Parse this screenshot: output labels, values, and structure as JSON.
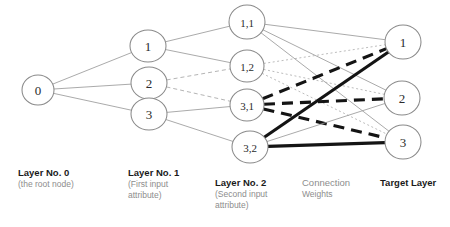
{
  "figure": {
    "background": "#ffffff"
  },
  "colors": {
    "node_stroke": "#8a8a8a",
    "node_fill": "#ffffff",
    "node_label": "#2b2b2b",
    "thin_edge": "#9b9b9b",
    "thick_edge": "#141414",
    "caption_title": "#1a1a1a",
    "caption_sub": "#8d8d8d"
  },
  "nodes": {
    "layer0": [
      {
        "id": "n0",
        "label": "0",
        "cx": 38,
        "cy": 90,
        "rx": 16,
        "ry": 15
      }
    ],
    "layer1": [
      {
        "id": "l1a",
        "label": "1",
        "cx": 148,
        "cy": 46,
        "rx": 18,
        "ry": 16
      },
      {
        "id": "l1b",
        "label": "2",
        "cx": 149,
        "cy": 83,
        "rx": 18,
        "ry": 16
      },
      {
        "id": "l1c",
        "label": "3",
        "cx": 149,
        "cy": 114,
        "rx": 18,
        "ry": 16
      }
    ],
    "layer2": [
      {
        "id": "l2a",
        "label": "1,1",
        "cx": 247,
        "cy": 22,
        "rx": 18,
        "ry": 17
      },
      {
        "id": "l2b",
        "label": "1,2",
        "cx": 247,
        "cy": 66,
        "rx": 17,
        "ry": 16
      },
      {
        "id": "l2c",
        "label": "3,1",
        "cx": 247,
        "cy": 105,
        "rx": 17,
        "ry": 16
      },
      {
        "id": "l2d",
        "label": "3,2",
        "cx": 250,
        "cy": 147,
        "rx": 18,
        "ry": 16
      }
    ],
    "target": [
      {
        "id": "t1",
        "label": "1",
        "cx": 403,
        "cy": 42,
        "rx": 18,
        "ry": 17
      },
      {
        "id": "t2",
        "label": "2",
        "cx": 402,
        "cy": 98,
        "rx": 18,
        "ry": 17
      },
      {
        "id": "t3",
        "label": "3",
        "cx": 403,
        "cy": 142,
        "rx": 18,
        "ry": 17
      }
    ]
  },
  "edges": [
    {
      "from": "n0",
      "to": "l1a",
      "style": "thin-solid"
    },
    {
      "from": "n0",
      "to": "l1b",
      "style": "thin-solid"
    },
    {
      "from": "n0",
      "to": "l1c",
      "style": "thin-solid"
    },
    {
      "from": "l1a",
      "to": "l2a",
      "style": "thin-solid"
    },
    {
      "from": "l1a",
      "to": "l2b",
      "style": "thin-solid"
    },
    {
      "from": "l1b",
      "to": "l2b",
      "style": "thin-dashed"
    },
    {
      "from": "l1b",
      "to": "l2c",
      "style": "thin-dashed"
    },
    {
      "from": "l1c",
      "to": "l2c",
      "style": "thin-solid"
    },
    {
      "from": "l1c",
      "to": "l2d",
      "style": "thin-solid"
    },
    {
      "from": "l2a",
      "to": "t1",
      "style": "thin-solid"
    },
    {
      "from": "l2a",
      "to": "t2",
      "style": "thin-solid"
    },
    {
      "from": "l2a",
      "to": "t3",
      "style": "thin-solid"
    },
    {
      "from": "l2b",
      "to": "t1",
      "style": "thin-dotted"
    },
    {
      "from": "l2b",
      "to": "t2",
      "style": "thin-dotted"
    },
    {
      "from": "l2b",
      "to": "t3",
      "style": "thin-dotted"
    },
    {
      "from": "l2c",
      "to": "t1",
      "style": "thick-dashed"
    },
    {
      "from": "l2c",
      "to": "t2",
      "style": "thick-dashed"
    },
    {
      "from": "l2c",
      "to": "t3",
      "style": "thick-dashed"
    },
    {
      "from": "l2d",
      "to": "t1",
      "style": "thick-solid"
    },
    {
      "from": "l2d",
      "to": "t2",
      "style": "thin-solid"
    },
    {
      "from": "l2d",
      "to": "t3",
      "style": "thick-solid"
    }
  ],
  "captions": [
    {
      "name": "layer-0",
      "title": "Layer No. 0",
      "sub": "(the root node)",
      "sub2": "",
      "x": 18,
      "y": 167,
      "plain": false
    },
    {
      "name": "layer-1",
      "title": "Layer No. 1",
      "sub": "(First input",
      "sub2": "attribute)",
      "x": 128,
      "y": 167,
      "plain": false
    },
    {
      "name": "layer-2",
      "title": "Layer No. 2",
      "sub": "(Second input",
      "sub2": "attribute)",
      "x": 215,
      "y": 177,
      "plain": false
    },
    {
      "name": "connection-weights",
      "title": "Connection",
      "sub": "Weights",
      "sub2": "",
      "x": 302,
      "y": 177,
      "plain": true
    },
    {
      "name": "target-layer",
      "title": "Target Layer",
      "sub": "",
      "sub2": "",
      "x": 380,
      "y": 177,
      "plain": false
    }
  ]
}
